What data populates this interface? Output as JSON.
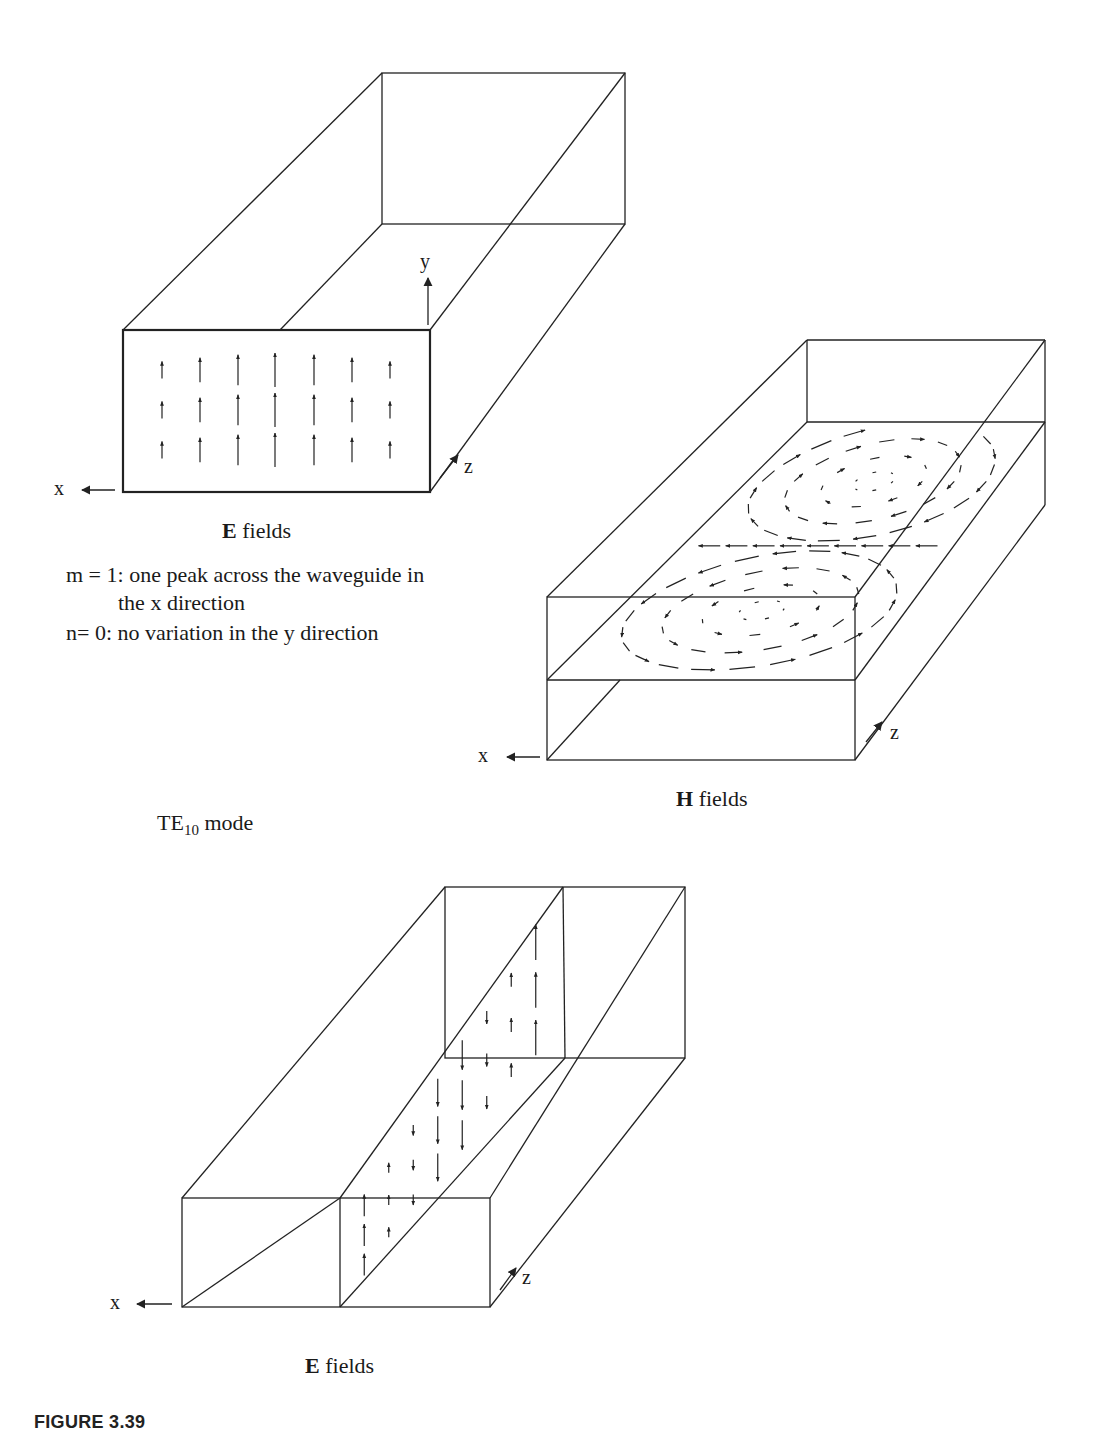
{
  "figure": {
    "caption": "FIGURE 3.39",
    "mode_label": {
      "prefix": "TE",
      "subscript": "10",
      "suffix": " mode"
    }
  },
  "top_e_fields": {
    "title_bold": "E",
    "title_rest": " fields",
    "axes": {
      "x": "x",
      "y": "y",
      "z": "z"
    },
    "notes": [
      "m = 1: one peak across the waveguide in",
      "the x direction",
      "n= 0:  no variation in the y direction"
    ],
    "arrow_columns_relative_length": [
      0.3,
      0.6,
      0.85,
      1.0,
      0.85,
      0.6,
      0.3
    ],
    "arrow_rows": 3
  },
  "h_fields": {
    "title_bold": "H",
    "title_rest": " fields",
    "axes": {
      "x": "x",
      "z": "z"
    },
    "description": "Two counter-rotating loops of magnetic field lines in the horizontal mid-plane"
  },
  "bottom_e_fields": {
    "title_bold": "E",
    "title_rest": " fields",
    "axes": {
      "x": "x",
      "z": "z"
    },
    "description": "Vertical E-field arrows on the longitudinal mid-plane, alternating up/down along z"
  },
  "colors": {
    "line": "#222222",
    "background": "#ffffff"
  }
}
